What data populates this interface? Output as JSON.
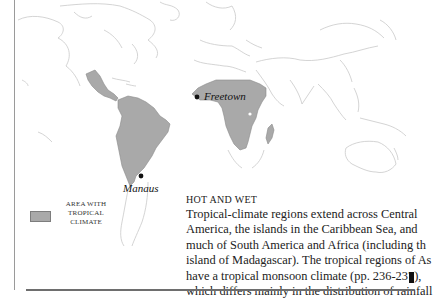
{
  "map": {
    "region_fill": "#a9a9a9",
    "coast_color": "#c8c8c8",
    "cities": [
      {
        "name": "Manaus",
        "dot": [
          141,
          176
        ]
      },
      {
        "name": "Freetown",
        "dot": [
          197,
          97
        ]
      }
    ]
  },
  "legend": {
    "swatch_color": "#a9a9a9",
    "label_lines": [
      "Area with",
      "tropical",
      "climate"
    ]
  },
  "caption": {
    "title": "Hot and wet",
    "body_lines": [
      "Tropical-climate regions extend across Central",
      "America, the islands in the Caribbean Sea, and",
      "much of South America and Africa (including th",
      "island of Madagascar). The tropical regions of As",
      "have a tropical monsoon climate (pp. 236-237),",
      "which differs mainly in the distribution of rainfall"
    ]
  }
}
